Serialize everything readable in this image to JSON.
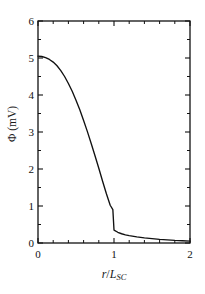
{
  "chart_data": {
    "type": "line",
    "title": "",
    "xlabel": "r/L_SC",
    "xlabel_parts": {
      "numerator": "r",
      "slash": "/",
      "denominator": "L",
      "subscript": "SC"
    },
    "ylabel": "Φ (mV)",
    "ylabel_symbol": "Φ",
    "ylabel_unit": "(mV)",
    "xlim": [
      0,
      2
    ],
    "ylim": [
      0,
      6
    ],
    "xticks": [
      0,
      1,
      2
    ],
    "xtick_labels": [
      "0",
      "1",
      "2"
    ],
    "x_minor_step": 0.2,
    "yticks": [
      0,
      1,
      2,
      3,
      4,
      5,
      6
    ],
    "ytick_labels": [
      "0",
      "1",
      "2",
      "3",
      "4",
      "5",
      "6"
    ],
    "y_minor_step": 0.5,
    "grid": false,
    "legend": null,
    "frame": "box",
    "tick_direction": "in",
    "line_color": "#111111",
    "series": [
      {
        "name": "potential",
        "x": [
          0.0,
          0.05,
          0.1,
          0.15,
          0.2,
          0.25,
          0.3,
          0.35,
          0.4,
          0.45,
          0.5,
          0.55,
          0.6,
          0.65,
          0.7,
          0.75,
          0.8,
          0.85,
          0.9,
          0.95,
          0.985,
          1.0,
          1.05,
          1.1,
          1.15,
          1.2,
          1.3,
          1.4,
          1.5,
          1.6,
          1.7,
          1.8,
          1.9,
          2.0
        ],
        "values": [
          5.05,
          5.04,
          5.01,
          4.96,
          4.89,
          4.79,
          4.66,
          4.5,
          4.31,
          4.1,
          3.86,
          3.6,
          3.31,
          3.01,
          2.69,
          2.36,
          2.02,
          1.67,
          1.33,
          1.02,
          0.9,
          0.35,
          0.29,
          0.25,
          0.22,
          0.2,
          0.165,
          0.14,
          0.12,
          0.1,
          0.085,
          0.07,
          0.06,
          0.05
        ],
        "discontinuity_at_x": 1.0,
        "discontinuity_from": 0.9,
        "discontinuity_to": 0.35
      }
    ]
  },
  "axes": {
    "y_title_symbol": "Φ",
    "y_title_unit": "(mV)",
    "x_title_num": "r",
    "x_title_slash": "/",
    "x_title_den": "L",
    "x_title_sub": "SC"
  },
  "ytick_labels": {
    "t0": "0",
    "t1": "1",
    "t2": "2",
    "t3": "3",
    "t4": "4",
    "t5": "5",
    "t6": "6"
  },
  "xtick_labels": {
    "t0": "0",
    "t1": "1",
    "t2": "2"
  }
}
